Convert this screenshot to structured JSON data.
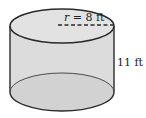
{
  "figure": {
    "shape": "cylinder",
    "radius_label": "r = 8 ft",
    "radius_var": "r",
    "radius_value": "= 8 ft",
    "height_label": "11 ft",
    "fill_color": "#dcdcdc",
    "stroke_color": "#2a2a2a"
  }
}
